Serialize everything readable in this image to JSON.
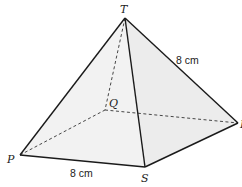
{
  "diagram": {
    "type": "square-based pyramid",
    "colors": {
      "edge": "#1a1a1a",
      "hidden_edge": "#333333",
      "face_fill": "#f0f0f0",
      "base_fill": "#e8e8e8"
    },
    "vertices": {
      "T": {
        "label": "T",
        "x": 125,
        "y": 18
      },
      "P": {
        "label": "P",
        "x": 20,
        "y": 155
      },
      "S": {
        "label": "S",
        "x": 145,
        "y": 167
      },
      "R": {
        "label": "R",
        "x": 238,
        "y": 123
      },
      "Q": {
        "label": "Q",
        "x": 105,
        "y": 110
      }
    },
    "edges": {
      "visible": [
        "TP",
        "TS",
        "TR",
        "PS",
        "SR"
      ],
      "hidden": [
        "TQ",
        "PQ",
        "QR"
      ]
    },
    "measurements": {
      "TR": "8 cm",
      "PS": "8 cm"
    }
  }
}
